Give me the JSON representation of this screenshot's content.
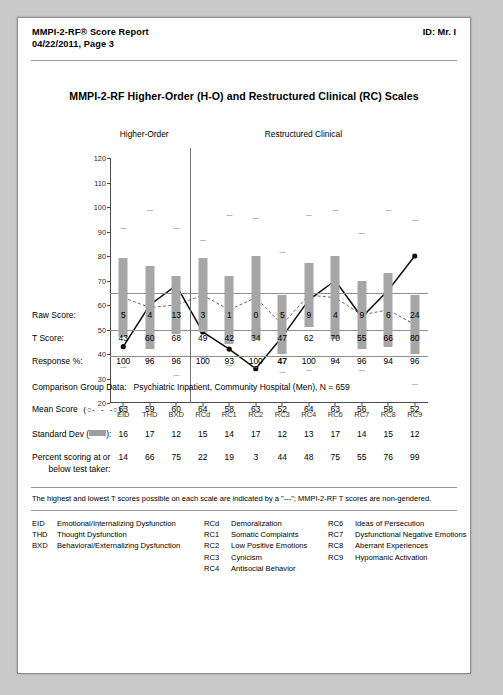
{
  "header": {
    "title_line1": "MMPI-2-RF® Score Report",
    "title_line2": "04/22/2011, Page 3",
    "id": "ID: Mr. I"
  },
  "chart_title": "MMPI-2-RF Higher-Order (H-O) and Restructured Clinical (RC) Scales",
  "sections": [
    {
      "label": "Higher-Order"
    },
    {
      "label": "Restructured Clinical"
    }
  ],
  "rows": {
    "raw_score_label": "Raw Score:",
    "t_score_label": "T Score:",
    "response_label": "Response %:",
    "comparison_label": "Comparison Group Data:",
    "comparison_value": "Psychiatric Inpatient, Community Hospital (Men), N = 659",
    "mean_label": "Mean Score",
    "mean_symbol": "(○- - -○):",
    "sd_label": "Standard Dev (",
    "sd_label_end": "):",
    "percent_label_line1": "Percent scoring at or",
    "percent_label_line2": "below test taker:"
  },
  "footnote": "The highest and lowest T scores possible on each scale are indicated by a \"---\"; MMPI-2-RF T scores are non-gendered.",
  "legend": {
    "col1": [
      {
        "key": "EID",
        "text": "Emotional/Internalizing Dysfunction"
      },
      {
        "key": "THD",
        "text": "Thought Dysfunction"
      },
      {
        "key": "BXD",
        "text": "Behavioral/Externalizing Dysfunction"
      }
    ],
    "col2": [
      {
        "key": "RCd",
        "text": "Demoralization"
      },
      {
        "key": "RC1",
        "text": "Somatic Complaints"
      },
      {
        "key": "RC2",
        "text": "Low Positive Emotions"
      },
      {
        "key": "RC3",
        "text": "Cynicism"
      },
      {
        "key": "RC4",
        "text": "Antisocial Behavior"
      }
    ],
    "col3": [
      {
        "key": "RC6",
        "text": "Ideas of Persecution"
      },
      {
        "key": "RC7",
        "text": "Dysfunctional Negative Emotions"
      },
      {
        "key": "RC8",
        "text": "Aberrant Experiences"
      },
      {
        "key": "RC9",
        "text": "Hypomanic Activation"
      }
    ]
  },
  "chart_data": {
    "type": "line",
    "title": "MMPI-2-RF Higher-Order (H-O) and Restructured Clinical (RC) Scales",
    "xlabel": "",
    "ylabel": "T Score",
    "ylim": [
      20,
      120
    ],
    "yticks": [
      20,
      30,
      40,
      50,
      60,
      70,
      80,
      90,
      100,
      110,
      120
    ],
    "grid": false,
    "reference_lines": [
      65,
      50,
      39
    ],
    "categories": [
      "EID",
      "THD",
      "BXD",
      "RCd",
      "RC1",
      "RC2",
      "RC3",
      "RC4",
      "RC6",
      "RC7",
      "RC8",
      "RC9"
    ],
    "group_split_after": "BXD",
    "series": [
      {
        "name": "T Score",
        "style": "solid-filled-circle",
        "values": [
          43,
          60,
          68,
          49,
          42,
          34,
          47,
          62,
          70,
          55,
          66,
          80
        ]
      },
      {
        "name": "Mean Score",
        "style": "dashed-open-circle",
        "values": [
          63,
          59,
          60,
          64,
          58,
          63,
          52,
          64,
          63,
          56,
          58,
          52
        ]
      }
    ],
    "bars": {
      "name": "Mean ± 1 SD",
      "color": "#a6a6a6",
      "low": [
        47,
        42,
        48,
        49,
        44,
        46,
        40,
        51,
        46,
        42,
        43,
        40
      ],
      "high": [
        79,
        76,
        72,
        79,
        72,
        80,
        64,
        77,
        80,
        70,
        73,
        64
      ]
    },
    "max_markers": [
      92,
      99,
      92,
      87,
      97,
      96,
      82,
      97,
      99,
      90,
      99,
      95
    ],
    "min_markers": [
      35,
      38,
      32,
      39,
      36,
      35,
      33,
      34,
      38,
      34,
      37,
      28
    ],
    "raw_score": [
      5,
      4,
      13,
      3,
      1,
      0,
      5,
      9,
      4,
      9,
      6,
      24
    ],
    "t_score": [
      43,
      60,
      68,
      49,
      42,
      34,
      47,
      62,
      70,
      55,
      66,
      80
    ],
    "response_pct": [
      100,
      96,
      96,
      100,
      93,
      100,
      47,
      100,
      94,
      96,
      94,
      96
    ],
    "response_pct_highlight": [
      6
    ],
    "mean_score": [
      63,
      59,
      60,
      64,
      58,
      63,
      52,
      64,
      63,
      56,
      58,
      52
    ],
    "standard_dev": [
      16,
      17,
      12,
      15,
      14,
      17,
      12,
      13,
      17,
      14,
      15,
      12
    ],
    "percent_below": [
      14,
      66,
      75,
      22,
      19,
      3,
      44,
      48,
      75,
      55,
      76,
      99
    ]
  }
}
